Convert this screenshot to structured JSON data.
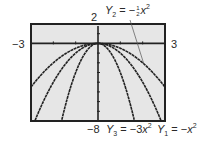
{
  "chart_data": {
    "type": "line",
    "title": "",
    "xlabel": "",
    "ylabel": "",
    "xlim": [
      -3,
      3
    ],
    "ylim": [
      -8,
      2
    ],
    "grid": false,
    "window_labels": {
      "xmin": "−3",
      "xmax": "3",
      "ymin": "−8",
      "ymax": "2"
    },
    "series": [
      {
        "name": "Y1 = −x^2",
        "label_text": "Y1 = −x²",
        "coefficient": -1
      },
      {
        "name": "Y2 = −(1/2)x^2",
        "label_text": "Y2 = −½x²",
        "coefficient": -0.5
      },
      {
        "name": "Y3 = −3x^2",
        "label_text": "Y3 = −3x²",
        "coefficient": -3
      }
    ],
    "annotations": [
      {
        "text": "Y2 = −½x²",
        "points_to": "Y2 curve near x = 2"
      },
      {
        "text": "Y3 = −3x²",
        "position": "below plot"
      },
      {
        "text": "Y1 = −x²",
        "position": "below plot, right"
      }
    ],
    "x_ticks": [
      -3,
      -2,
      -1,
      0,
      1,
      2,
      3
    ],
    "y_ticks": [
      2,
      1,
      0,
      -1,
      -2,
      -3,
      -4,
      -5,
      -6,
      -7,
      -8
    ]
  },
  "labels": {
    "ymax": "2",
    "ymin": "−8",
    "xmin": "−3",
    "xmax": "3",
    "y2": {
      "Y": "Y",
      "sub": "2",
      "eq": " = −",
      "num": "1",
      "den": "2",
      "x": "x",
      "sup": "2"
    },
    "y3": {
      "Y": "Y",
      "sub": "3",
      "eq": " = −3",
      "x": "x",
      "sup": "2"
    },
    "y1": {
      "Y": "Y",
      "sub": "1",
      "eq": " = −",
      "x": "x",
      "sup": "2"
    }
  },
  "colors": {
    "screen_bg": "#e6e6e6",
    "frame": "#222222",
    "curve": "#222222",
    "text": "#2a2a2a"
  }
}
